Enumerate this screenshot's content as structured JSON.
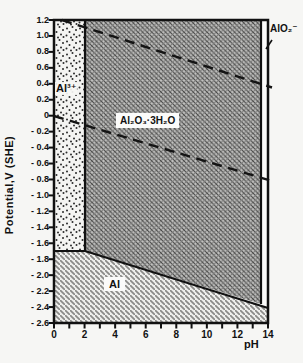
{
  "axes": {
    "y": {
      "title": "Potential,V (SHE)",
      "tick_labels": [
        "1.2",
        "1.0",
        "0.8",
        "0.6",
        "0.4",
        "0.2",
        "0",
        "- 0.2",
        "- 0.4",
        "- 0.6",
        "- 0.8",
        "- 1.0",
        "- 1.2",
        "- 1.4",
        "- 1.6",
        "- 1.8",
        "- 2.0",
        "- 2.2",
        "- 2.4",
        "- 2.6"
      ]
    },
    "x": {
      "title": "pH",
      "tick_labels": [
        "0",
        "2",
        "4",
        "6",
        "8",
        "10",
        "12",
        "14"
      ]
    }
  },
  "regions": {
    "al3plus": {
      "label": "Al³⁺",
      "texture": "stippled-dots"
    },
    "oxide": {
      "label": "Al₂O₃·3H₂O",
      "texture": "crosshatch"
    },
    "alo2": {
      "label": "AlO₂⁻",
      "texture": "plain-white"
    },
    "al": {
      "label": "Al",
      "texture": "diagonal-hatch"
    }
  },
  "chart_data": {
    "type": "area",
    "xlabel": "pH",
    "ylabel": "Potential,V (SHE)",
    "xlim": [
      0,
      14
    ],
    "ylim": [
      -2.6,
      1.2
    ],
    "x_ticks": [
      0,
      1,
      2,
      3,
      4,
      5,
      6,
      7,
      8,
      9,
      10,
      11,
      12,
      13,
      14
    ],
    "x_tick_labels_shown": [
      0,
      2,
      4,
      6,
      8,
      10,
      12,
      14
    ],
    "y_ticks_step": 0.2,
    "grid": false,
    "ink_color": "#111111",
    "paper_color": "#f6f6f4",
    "regions": [
      {
        "name": "Al³⁺",
        "extent": "pH 0–2, E above −1.7 V"
      },
      {
        "name": "Al₂O₃·3H₂O",
        "extent": "pH 2–13.5, above the Al metal boundary"
      },
      {
        "name": "AlO₂⁻",
        "extent": "pH 13.5–14, E above ≈ −2.4 V"
      },
      {
        "name": "Al",
        "extent": "below E = −1.7 V (pH 0–2) sloping to −2.4 V at pH 14"
      }
    ],
    "boundaries": [
      {
        "name": "Al³⁺ / Al₂O₃·3H₂O",
        "style": "solid",
        "points": [
          [
            2,
            1.2
          ],
          [
            2,
            -1.7
          ]
        ]
      },
      {
        "name": "Al³⁺ / Al",
        "style": "solid",
        "points": [
          [
            0,
            -1.7
          ],
          [
            2,
            -1.7
          ]
        ]
      },
      {
        "name": "Al / Al₂O₃·3H₂O",
        "style": "solid",
        "points": [
          [
            2,
            -1.7
          ],
          [
            14,
            -2.41
          ]
        ]
      },
      {
        "name": "Al₂O₃·3H₂O / AlO₂⁻",
        "style": "solid",
        "points": [
          [
            13.5,
            1.2
          ],
          [
            13.5,
            -2.38
          ]
        ]
      },
      {
        "name": "O₂/H₂O line",
        "style": "dashed",
        "points": [
          [
            0.5,
            1.2
          ],
          [
            14,
            0.4
          ]
        ]
      },
      {
        "name": "H₂O/H₂ line",
        "style": "dashed",
        "points": [
          [
            0,
            0.0
          ],
          [
            14,
            -0.83
          ]
        ]
      }
    ]
  }
}
